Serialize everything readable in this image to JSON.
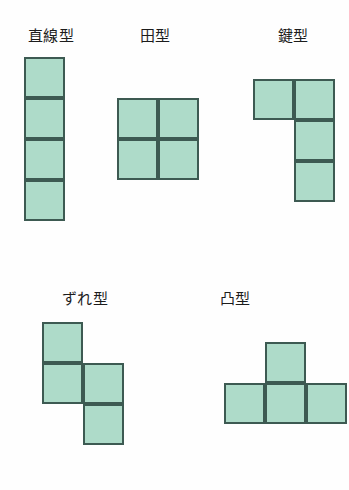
{
  "figure": {
    "title_present": false,
    "background_color": "#fefefe",
    "cell_fill_color": "#aedbc9",
    "cell_border_color": "#3d5a52",
    "label_color": "#1c1c1c",
    "cell_size_px": 41,
    "shapes": [
      {
        "id": "straight",
        "label": "直線型",
        "cell_count": 4,
        "grid_columns": 1,
        "grid_rows": 4,
        "cells": [
          [
            0,
            0
          ],
          [
            0,
            1
          ],
          [
            0,
            2
          ],
          [
            0,
            3
          ]
        ]
      },
      {
        "id": "square",
        "label": "田型",
        "cell_count": 4,
        "grid_columns": 2,
        "grid_rows": 2,
        "cells": [
          [
            0,
            0
          ],
          [
            1,
            0
          ],
          [
            0,
            1
          ],
          [
            1,
            1
          ]
        ]
      },
      {
        "id": "key",
        "label": "鍵型",
        "cell_count": 4,
        "grid_columns": 2,
        "grid_rows": 3,
        "cells": [
          [
            0,
            0
          ],
          [
            1,
            0
          ],
          [
            1,
            1
          ],
          [
            1,
            2
          ]
        ]
      },
      {
        "id": "offset",
        "label": "ずれ型",
        "cell_count": 4,
        "grid_columns": 2,
        "grid_rows": 3,
        "cells": [
          [
            0,
            0
          ],
          [
            0,
            1
          ],
          [
            1,
            1
          ],
          [
            1,
            2
          ]
        ]
      },
      {
        "id": "convex",
        "label": "凸型",
        "cell_count": 4,
        "grid_columns": 3,
        "grid_rows": 2,
        "cells": [
          [
            1,
            0
          ],
          [
            0,
            1
          ],
          [
            1,
            1
          ],
          [
            2,
            1
          ]
        ]
      }
    ]
  }
}
